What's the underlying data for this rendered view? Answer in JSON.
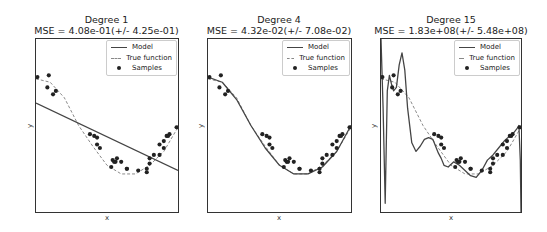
{
  "figure": {
    "panels": [
      {
        "title": "Degree 1",
        "subtitle": "MSE = 4.08e-01(+/- 4.25e-01)",
        "xlabel": "x",
        "ylabel": "y"
      },
      {
        "title": "Degree 4",
        "subtitle": "MSE = 4.32e-02(+/- 7.08e-02)",
        "xlabel": "x",
        "ylabel": "y"
      },
      {
        "title": "Degree 15",
        "subtitle": "MSE = 1.83e+08(+/- 5.48e+08)",
        "xlabel": "x",
        "ylabel": "y"
      }
    ],
    "legend": {
      "model": "Model",
      "true_function": "True function",
      "samples": "Samples"
    },
    "colors": {
      "model": "#444444",
      "true_function": "#888888",
      "samples": "#222222",
      "frame": "#333333"
    }
  },
  "chart_data": [
    {
      "type": "line",
      "title": "Degree 1",
      "subtitle": "MSE = 4.08e-01(+/- 4.25e-01)",
      "xlabel": "x",
      "ylabel": "y",
      "xlim": [
        0,
        1
      ],
      "ylim": [
        0,
        1
      ],
      "grid": false,
      "legend_position": "upper right",
      "series": [
        {
          "name": "Model",
          "style": "solid",
          "x": [
            0,
            1
          ],
          "y": [
            0.63,
            0.24
          ]
        },
        {
          "name": "True function",
          "style": "dashed",
          "x": [
            0,
            0.1,
            0.2,
            0.3,
            0.4,
            0.5,
            0.6,
            0.7,
            0.8,
            0.9,
            1.0
          ],
          "y": [
            0.77,
            0.75,
            0.66,
            0.5,
            0.38,
            0.27,
            0.22,
            0.22,
            0.27,
            0.35,
            0.49
          ]
        },
        {
          "name": "Samples",
          "style": "scatter",
          "x": [
            0.01,
            0.09,
            0.08,
            0.12,
            0.14,
            0.38,
            0.41,
            0.43,
            0.43,
            0.45,
            0.54,
            0.53,
            0.55,
            0.56,
            0.57,
            0.6,
            0.64,
            0.64,
            0.72,
            0.78,
            0.78,
            0.8,
            0.8,
            0.83,
            0.87,
            0.87,
            0.9,
            0.9,
            0.92,
            0.93,
            0.94,
            0.99
          ],
          "y": [
            0.78,
            0.79,
            0.72,
            0.68,
            0.7,
            0.45,
            0.44,
            0.43,
            0.39,
            0.37,
            0.3,
            0.26,
            0.29,
            0.29,
            0.31,
            0.29,
            0.25,
            0.25,
            0.24,
            0.25,
            0.23,
            0.28,
            0.31,
            0.33,
            0.33,
            0.39,
            0.37,
            0.41,
            0.44,
            0.44,
            0.45,
            0.49
          ]
        }
      ]
    },
    {
      "type": "line",
      "title": "Degree 4",
      "subtitle": "MSE = 4.32e-02(+/- 7.08e-02)",
      "xlabel": "x",
      "ylabel": "y",
      "xlim": [
        0,
        1
      ],
      "ylim": [
        0,
        1
      ],
      "grid": false,
      "legend_position": "upper right",
      "series": [
        {
          "name": "Model",
          "style": "solid",
          "x": [
            0,
            0.1,
            0.2,
            0.3,
            0.4,
            0.5,
            0.6,
            0.7,
            0.8,
            0.9,
            1.0
          ],
          "y": [
            0.78,
            0.75,
            0.65,
            0.5,
            0.37,
            0.27,
            0.22,
            0.22,
            0.26,
            0.35,
            0.5
          ]
        },
        {
          "name": "True function",
          "style": "dashed",
          "x": [
            0,
            0.1,
            0.2,
            0.3,
            0.4,
            0.5,
            0.6,
            0.7,
            0.8,
            0.9,
            1.0
          ],
          "y": [
            0.77,
            0.75,
            0.66,
            0.5,
            0.38,
            0.27,
            0.22,
            0.22,
            0.27,
            0.35,
            0.49
          ]
        },
        {
          "name": "Samples",
          "style": "scatter",
          "x": [
            0.01,
            0.09,
            0.08,
            0.12,
            0.14,
            0.38,
            0.41,
            0.43,
            0.43,
            0.45,
            0.54,
            0.53,
            0.55,
            0.56,
            0.57,
            0.6,
            0.64,
            0.64,
            0.72,
            0.78,
            0.78,
            0.8,
            0.8,
            0.83,
            0.87,
            0.87,
            0.9,
            0.9,
            0.92,
            0.93,
            0.94,
            0.99
          ],
          "y": [
            0.78,
            0.79,
            0.72,
            0.68,
            0.7,
            0.45,
            0.44,
            0.43,
            0.39,
            0.37,
            0.3,
            0.26,
            0.29,
            0.29,
            0.31,
            0.29,
            0.25,
            0.25,
            0.24,
            0.25,
            0.23,
            0.28,
            0.31,
            0.33,
            0.33,
            0.39,
            0.37,
            0.41,
            0.44,
            0.44,
            0.45,
            0.49
          ]
        }
      ]
    },
    {
      "type": "line",
      "title": "Degree 15",
      "subtitle": "MSE = 1.83e+08(+/- 5.48e+08)",
      "xlabel": "x",
      "ylabel": "y",
      "xlim": [
        0,
        1
      ],
      "ylim": [
        0,
        1
      ],
      "grid": false,
      "legend_position": "upper right",
      "series": [
        {
          "name": "Model",
          "style": "solid",
          "x": [
            0,
            0.015,
            0.03,
            0.045,
            0.06,
            0.075,
            0.09,
            0.11,
            0.13,
            0.15,
            0.17,
            0.19,
            0.22,
            0.25,
            0.28,
            0.31,
            0.34,
            0.37,
            0.39,
            0.41,
            0.43,
            0.45,
            0.48,
            0.52,
            0.56,
            0.6,
            0.64,
            0.68,
            0.72,
            0.76,
            0.8,
            0.84,
            0.88,
            0.92,
            0.95,
            0.97,
            0.985,
            0.995,
            1.0
          ],
          "y": [
            1.0,
            0.6,
            0.05,
            0.7,
            0.79,
            0.74,
            0.7,
            0.72,
            0.85,
            0.92,
            0.82,
            0.6,
            0.4,
            0.35,
            0.38,
            0.42,
            0.43,
            0.42,
            0.38,
            0.34,
            0.31,
            0.27,
            0.26,
            0.29,
            0.27,
            0.24,
            0.21,
            0.2,
            0.24,
            0.3,
            0.33,
            0.37,
            0.41,
            0.44,
            0.46,
            0.48,
            0.5,
            0.3,
            0.0
          ]
        },
        {
          "name": "True function",
          "style": "dashed",
          "x": [
            0,
            0.1,
            0.2,
            0.3,
            0.4,
            0.5,
            0.6,
            0.7,
            0.8,
            0.9,
            1.0
          ],
          "y": [
            0.77,
            0.75,
            0.66,
            0.5,
            0.38,
            0.27,
            0.22,
            0.22,
            0.27,
            0.35,
            0.49
          ]
        },
        {
          "name": "Samples",
          "style": "scatter",
          "x": [
            0.01,
            0.09,
            0.08,
            0.12,
            0.14,
            0.38,
            0.41,
            0.43,
            0.43,
            0.45,
            0.54,
            0.53,
            0.55,
            0.56,
            0.57,
            0.6,
            0.64,
            0.64,
            0.72,
            0.78,
            0.78,
            0.8,
            0.8,
            0.83,
            0.87,
            0.87,
            0.9,
            0.9,
            0.92,
            0.93,
            0.94,
            0.99
          ],
          "y": [
            0.78,
            0.79,
            0.72,
            0.68,
            0.7,
            0.45,
            0.44,
            0.43,
            0.39,
            0.37,
            0.3,
            0.26,
            0.29,
            0.29,
            0.31,
            0.29,
            0.25,
            0.25,
            0.24,
            0.25,
            0.23,
            0.28,
            0.31,
            0.33,
            0.33,
            0.39,
            0.37,
            0.41,
            0.44,
            0.44,
            0.45,
            0.49
          ]
        }
      ]
    }
  ]
}
